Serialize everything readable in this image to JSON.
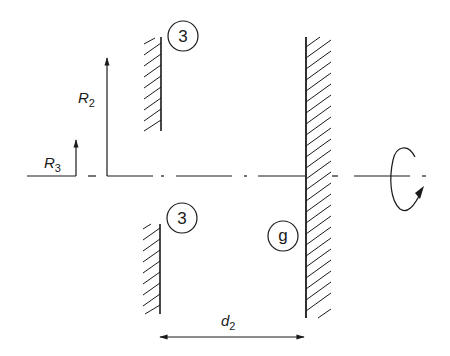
{
  "diagram": {
    "type": "mechanical-schematic",
    "colors": {
      "ink": "#1a1a1a",
      "background": "#ffffff"
    },
    "labels": {
      "r2_main": "R",
      "r2_sub": "2",
      "r3_main": "R",
      "r3_sub": "3",
      "d2_main": "d",
      "d2_sub": "2",
      "circle_top": "3",
      "circle_bottom": "3",
      "circle_g": "g"
    },
    "elements": [
      {
        "id": "wall-upper-left",
        "label": "3",
        "hatch_side": "left"
      },
      {
        "id": "wall-lower-left",
        "label": "3",
        "hatch_side": "left"
      },
      {
        "id": "wall-right",
        "label": "g",
        "hatch_side": "right"
      },
      {
        "id": "axis",
        "style": "dash-dot centerline"
      },
      {
        "id": "rotation-symbol",
        "meaning": "rotation about axis"
      },
      {
        "id": "dimension-R2",
        "label": "R2"
      },
      {
        "id": "dimension-R3",
        "label": "R3"
      },
      {
        "id": "dimension-d2",
        "label": "d2"
      }
    ]
  }
}
